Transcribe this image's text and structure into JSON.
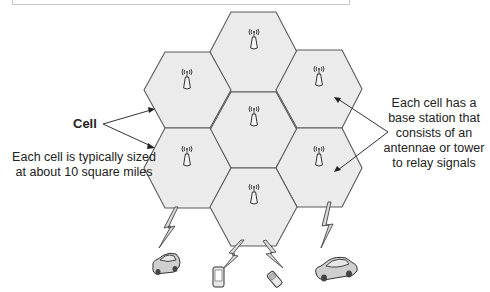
{
  "diagram": {
    "labels": {
      "cell": "Cell",
      "cell_size_note": "Each cell is typically sized at about 10 square miles",
      "base_station_note": "Each cell has a base station that consists of an antennae or tower to relay signals"
    },
    "cells": [
      {
        "id": "top",
        "has_antenna": true
      },
      {
        "id": "upper-left",
        "has_antenna": true
      },
      {
        "id": "upper-right",
        "has_antenna": true
      },
      {
        "id": "center",
        "has_antenna": true
      },
      {
        "id": "lower-left",
        "has_antenna": true
      },
      {
        "id": "lower-right",
        "has_antenna": true
      },
      {
        "id": "bottom",
        "has_antenna": true
      }
    ],
    "devices": [
      {
        "type": "car",
        "name": "left-car"
      },
      {
        "type": "smartphone",
        "name": "smartphone"
      },
      {
        "type": "flip-phone",
        "name": "flip-phone"
      },
      {
        "type": "car",
        "name": "right-car"
      }
    ],
    "icons": {
      "antenna": "antenna-tower-icon",
      "signal": "lightning-signal-icon"
    },
    "colors": {
      "cell_fill": "#ebebeb",
      "cell_stroke": "#5a5a5a",
      "text": "#222222"
    }
  }
}
